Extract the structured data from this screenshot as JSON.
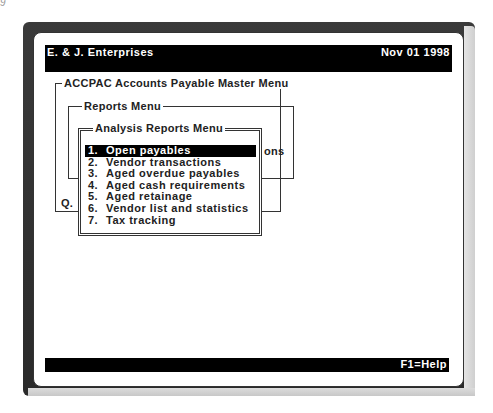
{
  "corner_mark": "9",
  "header": {
    "company": "E. & J. Enterprises",
    "date": "Nov 01 1998"
  },
  "master_menu": {
    "title": "ACCPAC Accounts Payable Master Menu",
    "partial_item": "Q."
  },
  "reports_menu": {
    "title": "Reports Menu",
    "partial_item": "ons"
  },
  "analysis_menu": {
    "title": "Analysis Reports Menu",
    "selected_index": 0,
    "items": [
      {
        "num": "1.",
        "label": "Open payables"
      },
      {
        "num": "2.",
        "label": "Vendor transactions"
      },
      {
        "num": "3.",
        "label": "Aged overdue payables"
      },
      {
        "num": "4.",
        "label": "Aged cash requirements"
      },
      {
        "num": "5.",
        "label": "Aged retainage"
      },
      {
        "num": "6.",
        "label": "Vendor list and statistics"
      },
      {
        "num": "7.",
        "label": "Tax tracking"
      }
    ]
  },
  "footer": {
    "help": "F1=Help"
  },
  "colors": {
    "bar_bg": "#000000",
    "bar_fg": "#ffffff",
    "screen_bg": "#ffffff",
    "bezel": "#2a2a2a"
  }
}
